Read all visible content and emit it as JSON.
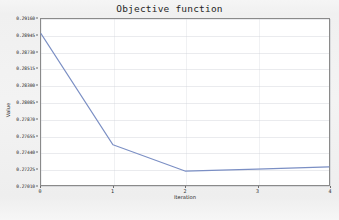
{
  "chart_data": {
    "type": "line",
    "title": "Objective function",
    "xlabel": "Iteration",
    "ylabel": "Value",
    "x": [
      0,
      1,
      2,
      3,
      4
    ],
    "categories": [
      "0",
      "1",
      "2",
      "3",
      "4"
    ],
    "values": [
      0.2897,
      0.2753,
      0.2719,
      0.27215,
      0.27245
    ],
    "series": [
      {
        "name": "Objective function",
        "values": [
          0.2897,
          0.2753,
          0.2719,
          0.27215,
          0.27245
        ]
      }
    ],
    "xlim": [
      0,
      4
    ],
    "ylim": [
      0.2701,
      0.2916
    ],
    "ytick_step": 0.00215,
    "ytick_labels": [
      "0.29160",
      "0.28945",
      "0.28730",
      "0.28515",
      "0.28300",
      "0.28085",
      "0.27870",
      "0.27655",
      "0.27440",
      "0.27225",
      "0.27010"
    ],
    "ytick_values": [
      0.2916,
      0.28945,
      0.2873,
      0.28515,
      0.283,
      0.28085,
      0.2787,
      0.27655,
      0.2744,
      0.27225,
      0.2701
    ],
    "xtick_labels": [
      "0",
      "1",
      "2",
      "3",
      "4"
    ],
    "xtick_values": [
      0,
      1,
      2,
      3,
      4
    ],
    "grid": true,
    "legend": null,
    "legend_position": "none",
    "line_color": "#7b8fc4",
    "plot_background": "#ffffff",
    "figure_background": "#f2f2f2",
    "axis_color": "#8a8a8a"
  },
  "caption": {
    "text": ""
  }
}
